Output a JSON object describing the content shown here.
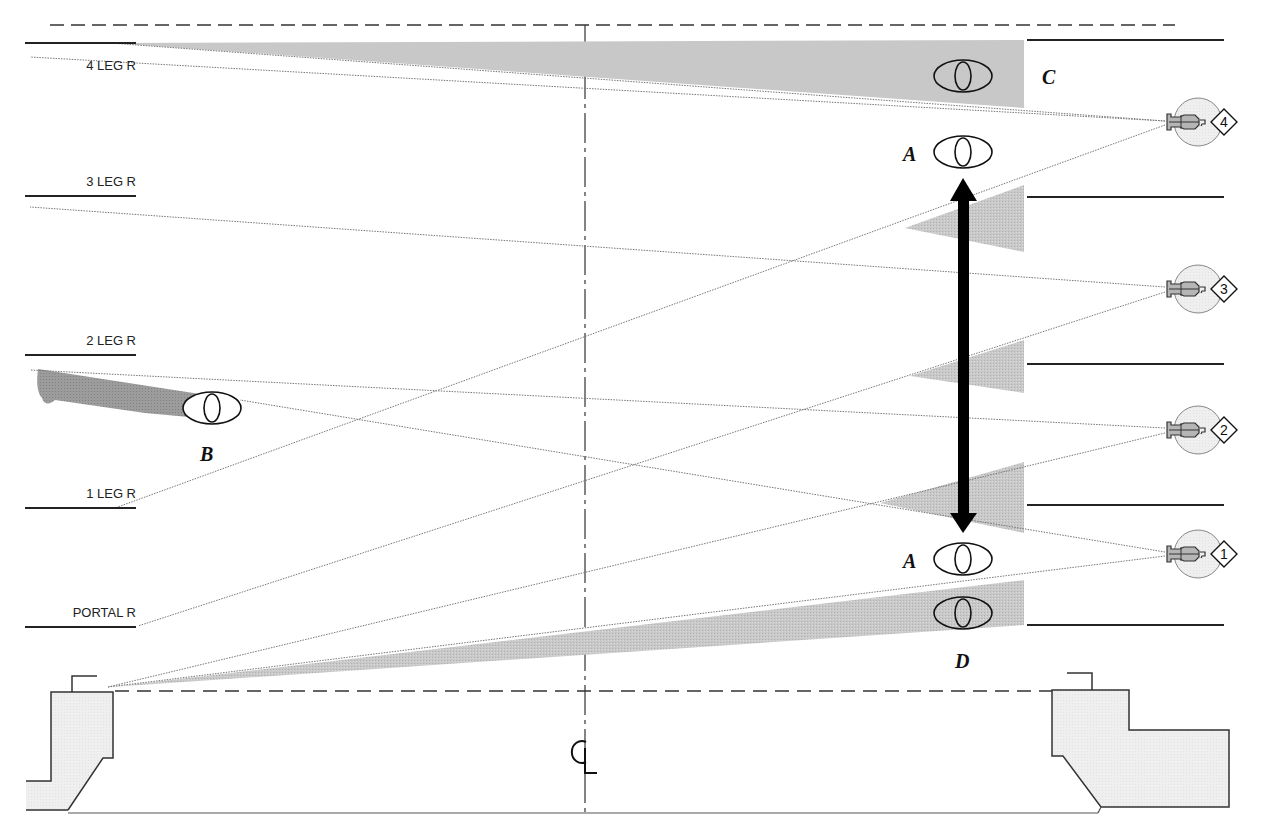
{
  "diagram": {
    "colors": {
      "beam": "#c8c8c8",
      "beam_dark": "#9a9a9a",
      "instrument_fill": "#d8d8d8",
      "set_fill": "#eeeeee",
      "line": "#222222",
      "arrow": "#000000"
    },
    "legs_left": [
      {
        "label": "4 LEG R",
        "x1": 25,
        "x2": 136,
        "y": 43,
        "label_x": 136,
        "label_y": 66
      },
      {
        "label": "3 LEG R",
        "x1": 25,
        "x2": 136,
        "y": 196,
        "label_x": 136,
        "label_y": 184
      },
      {
        "label": "2 LEG R",
        "x1": 25,
        "x2": 136,
        "y": 355,
        "label_x": 136,
        "label_y": 343
      },
      {
        "label": "1 LEG R",
        "x1": 25,
        "x2": 136,
        "y": 508,
        "label_x": 136,
        "label_y": 496
      },
      {
        "label": "PORTAL R",
        "x1": 25,
        "x2": 136,
        "y": 627,
        "label_x": 136,
        "label_y": 615
      }
    ],
    "legs_right": [
      {
        "x1": 1027,
        "x2": 1224,
        "y": 40
      },
      {
        "x1": 1027,
        "x2": 1224,
        "y": 197
      },
      {
        "x1": 1027,
        "x2": 1224,
        "y": 364
      },
      {
        "x1": 1027,
        "x2": 1224,
        "y": 505
      },
      {
        "x1": 1027,
        "x2": 1224,
        "y": 625
      }
    ],
    "centerline": {
      "label": "CL",
      "x": 585,
      "y_top": 22,
      "y_bottom": 812,
      "label_x": 573,
      "label_y": 762
    },
    "upstage_line": {
      "x1": 50,
      "x2": 1175,
      "y": 25
    },
    "plaster_line": {
      "x1": 110,
      "x2": 1055,
      "y": 691
    },
    "instruments": [
      {
        "id": "unit-4",
        "number": "4",
        "x": 1195,
        "y": 122
      },
      {
        "id": "unit-3",
        "number": "3",
        "x": 1195,
        "y": 289
      },
      {
        "id": "unit-2",
        "number": "2",
        "x": 1195,
        "y": 430
      },
      {
        "id": "unit-1",
        "number": "1",
        "x": 1195,
        "y": 554
      }
    ],
    "beams": [
      {
        "from": "unit-4",
        "upper": [
          110,
          43
        ],
        "lower": [
          30,
          57
        ],
        "shade_from_x": 110,
        "shade_edge": [
          [
            1024,
            40
          ],
          [
            1024,
            108
          ]
        ]
      },
      {
        "from": "unit-3",
        "upper": [
          30,
          508
        ],
        "lower": [
          30,
          207
        ]
      },
      {
        "from": "unit-2",
        "upper": [
          30,
          627
        ],
        "lower": [
          30,
          370
        ]
      },
      {
        "from": "unit-1",
        "upper": [
          108,
          687
        ],
        "lower": [
          110,
          686
        ]
      }
    ],
    "eyes": [
      {
        "label": "C",
        "x": 963,
        "y": 76,
        "label_x": 1042,
        "label_y": 83
      },
      {
        "label": "A",
        "x": 963,
        "y": 152,
        "label_x": 904,
        "label_y": 161
      },
      {
        "label": "A",
        "x": 963,
        "y": 560,
        "label_x": 904,
        "label_y": 569
      },
      {
        "label": "D",
        "x": 963,
        "y": 613,
        "label_x": 955,
        "label_y": 667
      },
      {
        "label": "B",
        "x": 212,
        "y": 408,
        "label_x": 200,
        "label_y": 461
      }
    ],
    "arrow": {
      "x": 963,
      "y_top": 180,
      "y_bottom": 532
    }
  }
}
